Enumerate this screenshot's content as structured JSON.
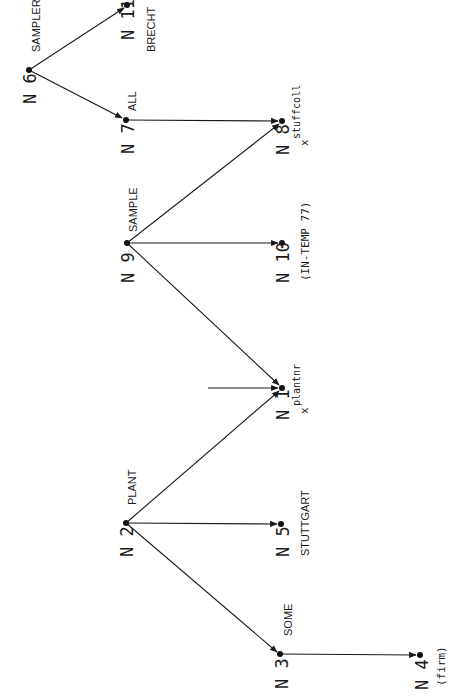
{
  "diagram": {
    "type": "semantic-network",
    "orientation": "rotated -90deg (text reads bottom-to-top)",
    "colors": {
      "ink": "#1a1a1a",
      "background": "#ffffff"
    },
    "nodes": [
      {
        "id": "N1",
        "label": "N 1",
        "x": 282,
        "y": 388,
        "annotation": "",
        "variable": "x",
        "superscript": "plantnr"
      },
      {
        "id": "N2",
        "label": "N 2",
        "x": 126,
        "y": 523,
        "annotation": "",
        "word": "PLANT"
      },
      {
        "id": "N3",
        "label": "N 3",
        "x": 280,
        "y": 654,
        "annotation": "",
        "word": "SOME"
      },
      {
        "id": "N4",
        "label": "N 4",
        "x": 420,
        "y": 655,
        "annotation": "(firm)"
      },
      {
        "id": "N5",
        "label": "N 5",
        "x": 281,
        "y": 524,
        "annotation": "STUTTGART"
      },
      {
        "id": "N6",
        "label": "N 6",
        "x": 29,
        "y": 70,
        "annotation": "",
        "word": "SAMPLER"
      },
      {
        "id": "N7",
        "label": "N 7",
        "x": 126,
        "y": 120,
        "annotation": "",
        "word": "ALL"
      },
      {
        "id": "N8",
        "label": "N 8",
        "x": 282,
        "y": 121,
        "annotation": "",
        "variable": "x",
        "superscript": "stuffcoll"
      },
      {
        "id": "N9",
        "label": "N 9",
        "x": 127,
        "y": 243,
        "annotation": "",
        "word": "SAMPLE"
      },
      {
        "id": "N10",
        "label": "N 10",
        "x": 282,
        "y": 243,
        "annotation": "(IN-TEMP 77)"
      },
      {
        "id": "N11",
        "label": "N 11",
        "x": 127,
        "y": 5,
        "annotation": "BRECHT"
      }
    ],
    "edges": [
      {
        "from": "N6",
        "to": "N11"
      },
      {
        "from": "N6",
        "to": "N7"
      },
      {
        "from": "N7",
        "to": "N8"
      },
      {
        "from": "N9",
        "to": "N8"
      },
      {
        "from": "N9",
        "to": "N10"
      },
      {
        "from": "N9",
        "to": "N1"
      },
      {
        "from": "external",
        "to": "N1",
        "start": [
          208,
          388
        ]
      },
      {
        "from": "N2",
        "to": "N1"
      },
      {
        "from": "N2",
        "to": "N5"
      },
      {
        "from": "N2",
        "to": "N3"
      },
      {
        "from": "N3",
        "to": "N4"
      }
    ],
    "texts": {
      "n1_label": "N 1",
      "n2_label": "N 2",
      "n3_label": "N 3",
      "n4_label": "N 4",
      "n5_label": "N 5",
      "n6_label": "N 6",
      "n7_label": "N 7",
      "n8_label": "N 8",
      "n9_label": "N 9",
      "n10_label": "N 10",
      "n11_label": "N 11",
      "w_sampler": "SAMPLER",
      "w_all": "ALL",
      "w_sample": "SAMPLE",
      "w_plant": "PLANT",
      "w_some": "SOME",
      "a_brecht": "BRECHT",
      "a_intemp": "(IN-TEMP 77)",
      "a_stuttgart": "STUTTGART",
      "a_firm": "(firm)",
      "v_x": "x",
      "sup_stuffcoll": "stuffcoll",
      "sup_plantnr": "plantnr"
    }
  }
}
